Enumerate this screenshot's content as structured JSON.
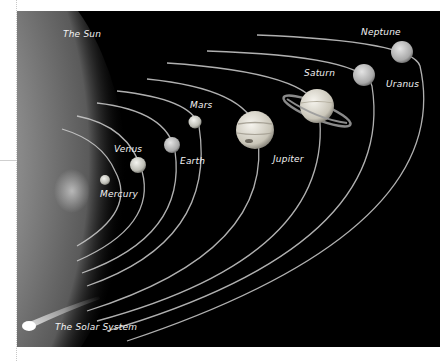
{
  "figure": {
    "title": "The Solar System",
    "sun_label": "The Sun",
    "planets": [
      {
        "name": "Mercury",
        "label": "Mercury"
      },
      {
        "name": "Venus",
        "label": "Venus"
      },
      {
        "name": "Earth",
        "label": "Earth"
      },
      {
        "name": "Mars",
        "label": "Mars"
      },
      {
        "name": "Jupiter",
        "label": "Jupiter"
      },
      {
        "name": "Saturn",
        "label": "Saturn"
      },
      {
        "name": "Uranus",
        "label": "Uranus"
      },
      {
        "name": "Neptune",
        "label": "Neptune"
      }
    ],
    "colors": {
      "background": "#000000",
      "sun": "#9a9a9a",
      "orbit": "#d0d0d0",
      "label": "#f2f2f2"
    }
  }
}
